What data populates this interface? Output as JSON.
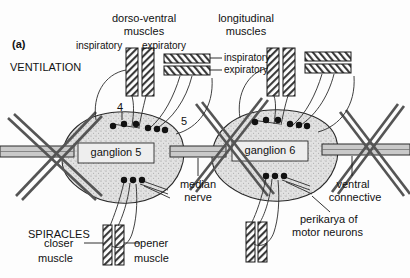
{
  "figure": {
    "panel_label": "(a)",
    "ink_color": "#1a1a1a",
    "ganglion_fill": "#d9d9d9"
  },
  "section_labels": {
    "ventilation": "VENTILATION",
    "spiracles": "SPIRACLES"
  },
  "muscle_groups": {
    "dorso_ventral": {
      "title_line1": "dorso-ventral",
      "title_line2": "muscles",
      "sub_left": "inspiratory",
      "sub_right": "expiratory"
    },
    "longitudinal": {
      "title_line1": "longitudinal",
      "title_line2": "muscles",
      "sub_top": "inspiratory",
      "sub_bottom": "expiratory"
    }
  },
  "ganglia": [
    {
      "label": "ganglion 5"
    },
    {
      "label": "ganglion 6"
    }
  ],
  "nerve_numbers": [
    {
      "label": "4"
    },
    {
      "label": "5"
    }
  ],
  "anatomy_labels": {
    "median_nerve_line1": "median",
    "median_nerve_line2": "nerve",
    "ventral_connective_line1": "ventral",
    "ventral_connective_line2": "connective",
    "perikarya_line1": "perikarya of",
    "perikarya_line2": "motor neurons"
  },
  "spiracle_muscles": {
    "closer_line1": "closer",
    "closer_line2": "muscle",
    "opener_line1": "opener",
    "opener_line2": "muscle"
  }
}
